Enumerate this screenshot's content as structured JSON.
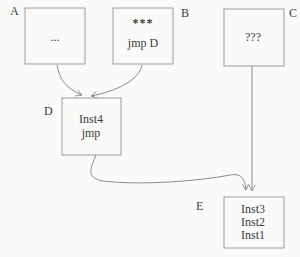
{
  "diagram": {
    "nodes": [
      {
        "id": "A",
        "label": "A",
        "lines": [
          "..."
        ]
      },
      {
        "id": "B",
        "label": "B",
        "lines": [
          "***",
          "jmp D"
        ]
      },
      {
        "id": "C",
        "label": "C",
        "lines": [
          "???"
        ]
      },
      {
        "id": "D",
        "label": "D",
        "lines": [
          "Inst4",
          "jmp"
        ]
      },
      {
        "id": "E",
        "label": "E",
        "lines": [
          "Inst3",
          "Inst2",
          "Inst1"
        ]
      }
    ],
    "edges": [
      {
        "from": "A",
        "to": "D"
      },
      {
        "from": "B",
        "to": "D"
      },
      {
        "from": "C",
        "to": "E"
      },
      {
        "from": "D",
        "to": "E"
      }
    ],
    "colors": {
      "background": "#fafaf8",
      "box_border": "#9b9b9b",
      "arrow": "#8a8a8a",
      "text": "#3a3a3a"
    }
  }
}
